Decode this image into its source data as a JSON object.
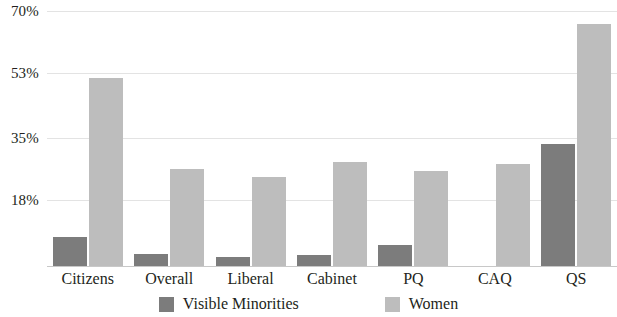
{
  "chart_data": {
    "type": "bar",
    "title": "",
    "subtitle": "",
    "xlabel": "",
    "ylabel": "",
    "categories": [
      "Citizens",
      "Overall",
      "Liberal",
      "Cabinet",
      "PQ",
      "CAQ",
      "QS"
    ],
    "series": [
      {
        "name": "Visible Minorities",
        "color": "#7c7c7c",
        "values": [
          8.0,
          3.3,
          2.5,
          3.0,
          5.8,
          0.0,
          33.5
        ]
      },
      {
        "name": "Women",
        "color": "#bdbdbd",
        "values": [
          51.5,
          26.5,
          24.5,
          28.5,
          26.0,
          28.0,
          66.5
        ]
      }
    ],
    "ylim": [
      0,
      73
    ],
    "ytick_values": [
      18,
      35,
      53,
      70
    ],
    "ytick_labels": [
      "18%",
      "35%",
      "53%",
      "70%"
    ],
    "grid": true,
    "legend_position": "bottom"
  },
  "legend": {
    "items": [
      {
        "label": "Visible Minorities",
        "swatch": "series-a-swatch"
      },
      {
        "label": "Women",
        "swatch": "series-b-swatch"
      }
    ]
  }
}
